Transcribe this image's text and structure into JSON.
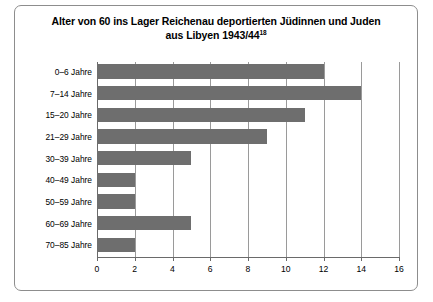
{
  "chart_data": {
    "type": "bar",
    "orientation": "horizontal",
    "title": "Alter von 60 ins Lager Reichenau deportierten Jüdinnen und Juden aus Libyen 1943/44",
    "title_line1": "Alter von 60 ins Lager Reichenau deportierten Jüdinnen und Juden",
    "title_line2": "aus Libyen 1943/44",
    "title_footnote": "18",
    "categories": [
      "0–6 Jahre",
      "7–14 Jahre",
      "15–20 Jahre",
      "21–29 Jahre",
      "30–39 Jahre",
      "40–49 Jahre",
      "50–59 Jahre",
      "60–69 Jahre",
      "70–85 Jahre"
    ],
    "values": [
      12,
      14,
      11,
      9,
      5,
      2,
      2,
      5,
      2
    ],
    "xlabel": "",
    "ylabel": "",
    "xlim": [
      0,
      16
    ],
    "xticks": [
      0,
      2,
      4,
      6,
      8,
      10,
      12,
      14,
      16
    ],
    "xtick_labels": [
      "0",
      "2",
      "4",
      "6",
      "8",
      "10",
      "12",
      "14",
      "16"
    ],
    "grid": "vertical",
    "legend": "none",
    "bar_color": "#6e6e6e",
    "grid_color": "#9a9a9a",
    "axis_color": "#6a6a6a",
    "frame_color": "#8d8d8d",
    "background": "#ffffff"
  }
}
